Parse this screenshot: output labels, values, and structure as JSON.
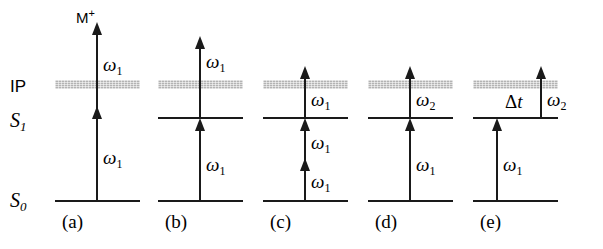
{
  "figure": {
    "type": "energy-level-diagram",
    "background_color": "#ffffff",
    "line_color": "#1a1a1a",
    "band_color": "#b3b3b3"
  },
  "axis_labels": {
    "ionization_potential": "IP",
    "excited_state": "S",
    "excited_state_sub": "1",
    "ground_state": "S",
    "ground_state_sub": "0"
  },
  "ion_label": {
    "text": "M",
    "charge": "+"
  },
  "symbols": {
    "omega": "ω",
    "omega_1_sub": "1",
    "omega_2_sub": "2",
    "delta_t_prefix": "Δ",
    "delta_t_italic": "t"
  },
  "panels": [
    {
      "id": "a",
      "caption": "(a)",
      "has_s1_line": false,
      "transitions": [
        {
          "photon": "ω",
          "sub": "1",
          "from": "S0",
          "to": "S1"
        },
        {
          "photon": "ω",
          "sub": "1",
          "from": "S1",
          "to": "ion"
        }
      ],
      "ion_product_shown": true
    },
    {
      "id": "b",
      "caption": "(b)",
      "has_s1_line": true,
      "transitions": [
        {
          "photon": "ω",
          "sub": "1",
          "from": "S0",
          "to": "S1"
        },
        {
          "photon": "ω",
          "sub": "1",
          "from": "S1",
          "to": "above-IP"
        }
      ],
      "ion_product_shown": false
    },
    {
      "id": "c",
      "caption": "(c)",
      "has_s1_line": true,
      "transitions": [
        {
          "photon": "ω",
          "sub": "1",
          "from": "S0",
          "to": "virtual"
        },
        {
          "photon": "ω",
          "sub": "1",
          "from": "virtual",
          "to": "S1"
        },
        {
          "photon": "ω",
          "sub": "1",
          "from": "S1",
          "to": "above-IP"
        }
      ],
      "ion_product_shown": false
    },
    {
      "id": "d",
      "caption": "(d)",
      "has_s1_line": true,
      "transitions": [
        {
          "photon": "ω",
          "sub": "1",
          "from": "S0",
          "to": "S1"
        },
        {
          "photon": "ω",
          "sub": "2",
          "from": "S1",
          "to": "above-IP"
        }
      ],
      "ion_product_shown": false
    },
    {
      "id": "e",
      "caption": "(e)",
      "has_s1_line": true,
      "delay_label": true,
      "transitions": [
        {
          "photon": "ω",
          "sub": "1",
          "from": "S0",
          "to": "S1"
        },
        {
          "photon": "ω",
          "sub": "2",
          "from": "S1",
          "to": "above-IP"
        }
      ],
      "ion_product_shown": false
    }
  ]
}
